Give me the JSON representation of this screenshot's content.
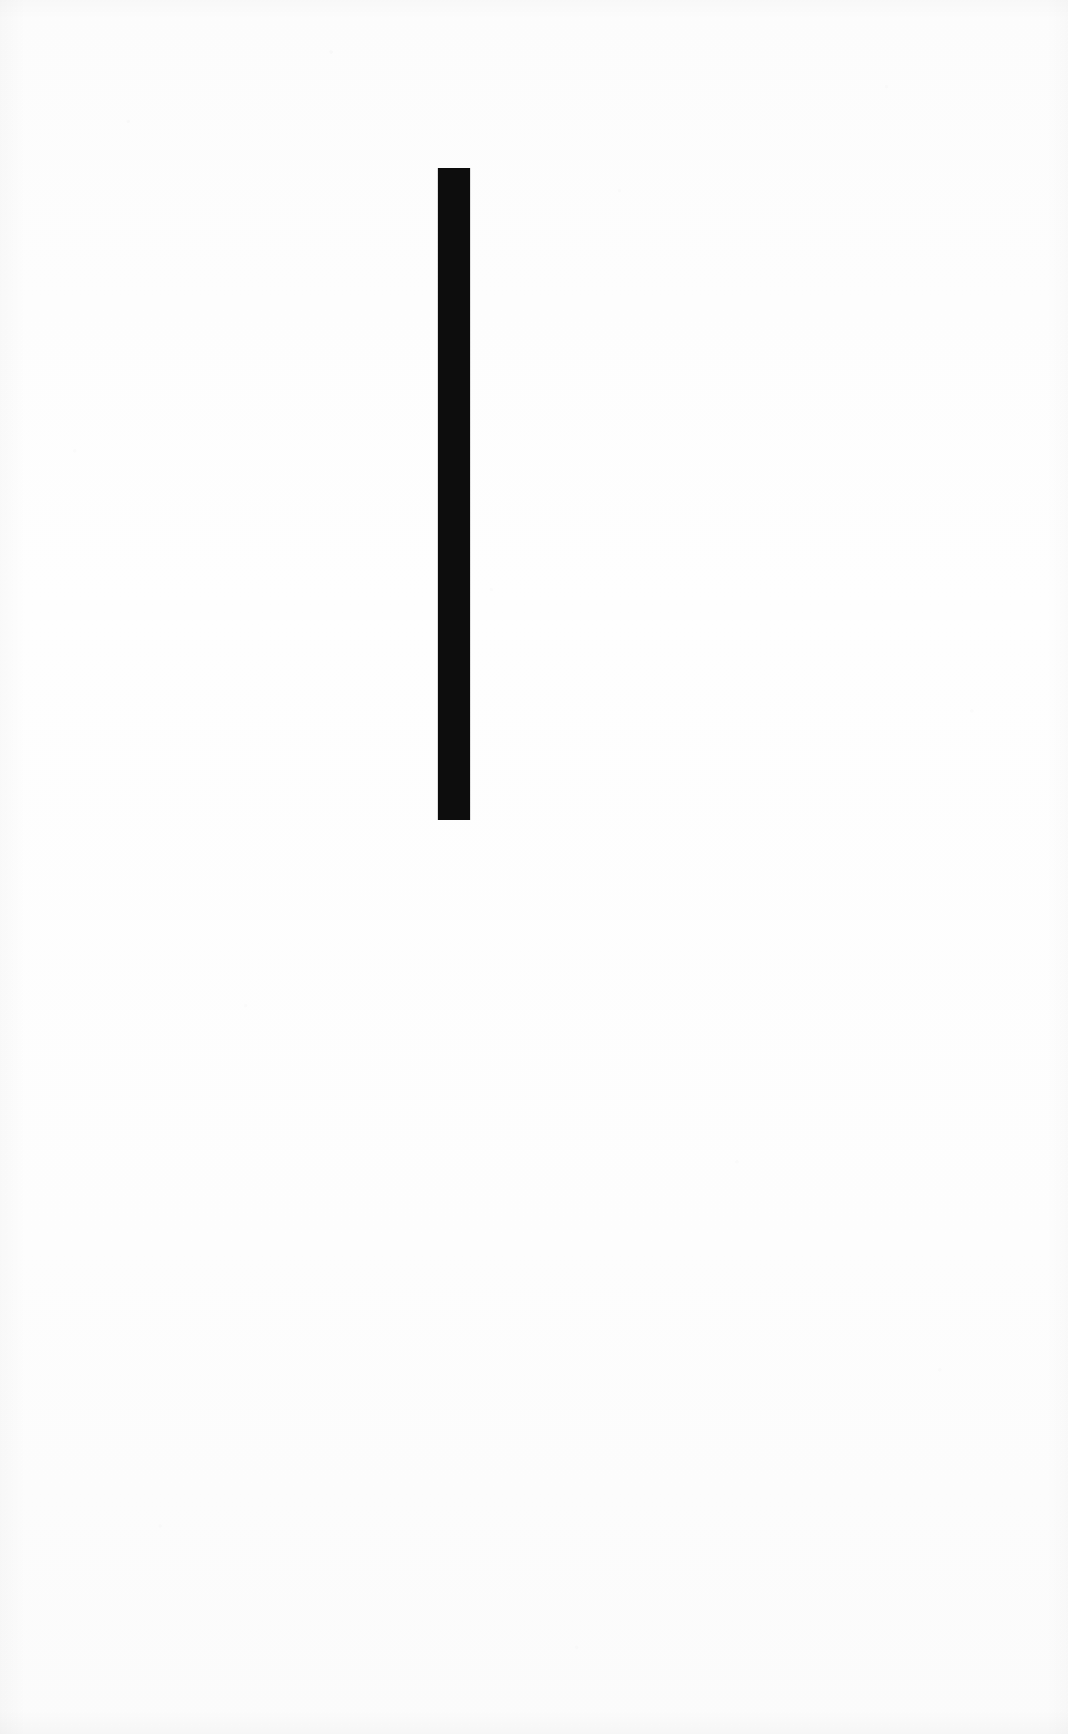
{
  "artwork": {
    "title": "Vertical Bar Composition",
    "medium_appearance": "black ink stroke on white paper",
    "canvas": {
      "width": 1068,
      "height": 1734,
      "background_color": "#fdfdfd",
      "ink_color": "#0d0d0d"
    }
  },
  "chart_data": {
    "type": "bar",
    "title": "",
    "subtitle": "",
    "xlabel": "",
    "ylabel": "",
    "orientation": "vertical",
    "grid": false,
    "axes_visible": false,
    "tick_labels_visible": false,
    "legend": false,
    "legend_position": "none",
    "categories": [
      ""
    ],
    "values": [
      652
    ],
    "value_unit": "px",
    "xlim": [
      0,
      1068
    ],
    "ylim": [
      0,
      1734
    ],
    "bars": [
      {
        "label": "",
        "x_left": 438,
        "x_right": 470,
        "x_center": 454,
        "y_top": 168,
        "y_bottom": 820,
        "width": 32,
        "height": 652,
        "color": "#0d0d0d"
      }
    ],
    "annotations": []
  },
  "elements": {
    "bar_name": "vertical-black-bar"
  }
}
